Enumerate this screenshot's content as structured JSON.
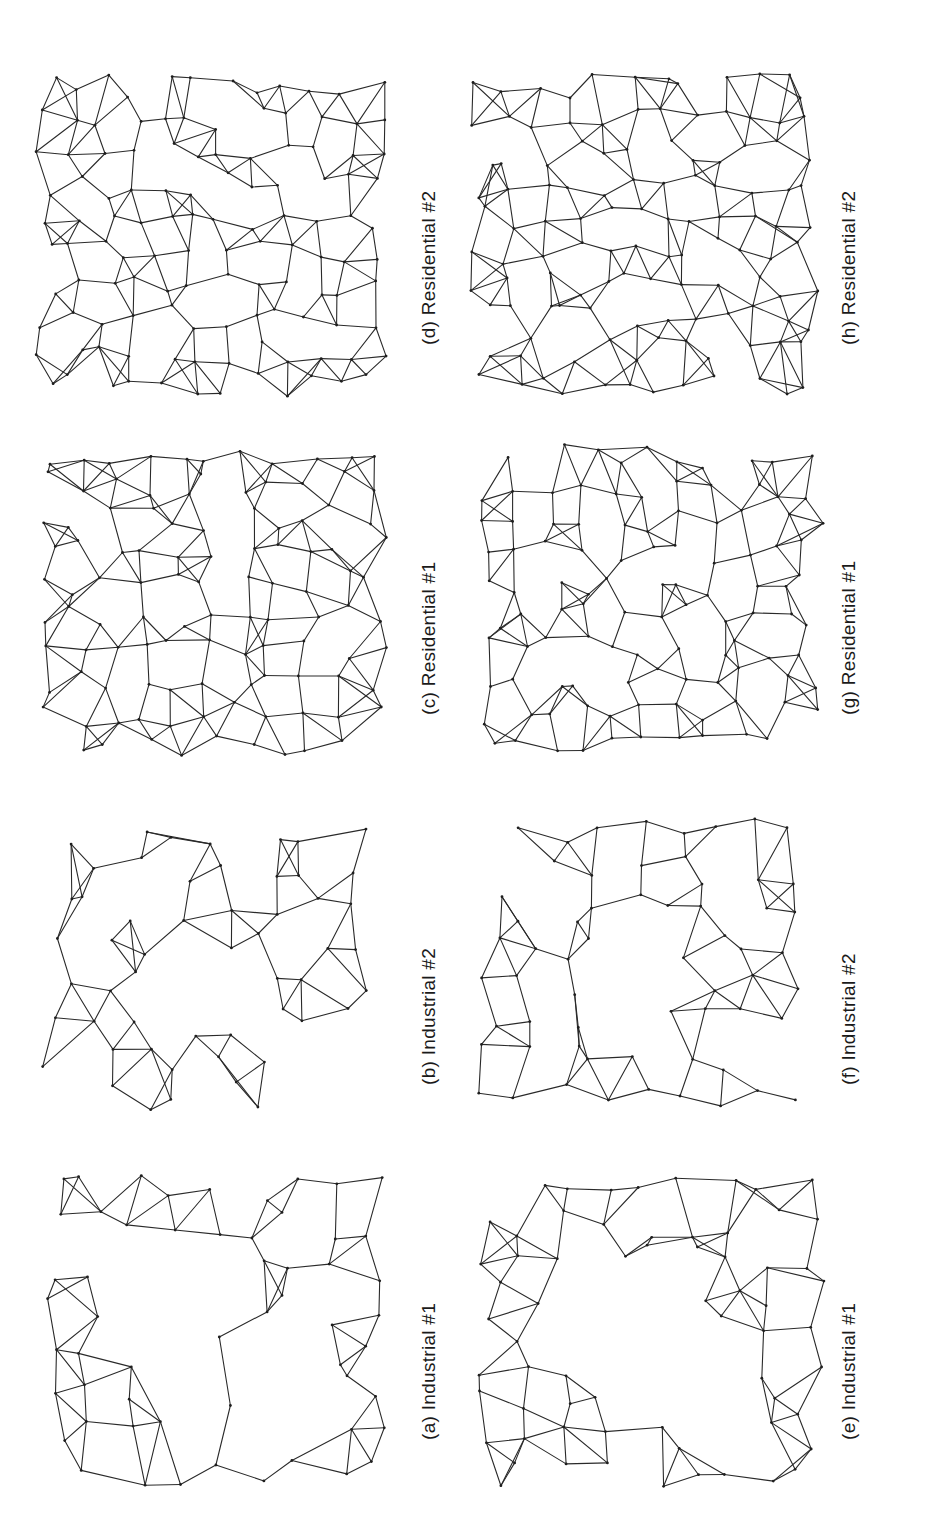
{
  "figure": {
    "orientation": "rotated-90-ccw",
    "panels": [
      {
        "id": "a",
        "caption": "(a)  Industrial #1",
        "column": "left",
        "row": 1,
        "cx": 215,
        "cy": 1330,
        "w": 370,
        "h": 330,
        "seed": 11,
        "nodes": 70,
        "style": "sparse-center"
      },
      {
        "id": "b",
        "caption": "(b)  Industrial #2",
        "column": "left",
        "row": 2,
        "cx": 205,
        "cy": 965,
        "w": 340,
        "h": 300,
        "seed": 23,
        "nodes": 62,
        "style": "blob"
      },
      {
        "id": "c",
        "caption": "(c)  Residential #1",
        "column": "left",
        "row": 3,
        "cx": 210,
        "cy": 600,
        "w": 360,
        "h": 330,
        "seed": 37,
        "nodes": 110,
        "style": "dense"
      },
      {
        "id": "d",
        "caption": "(d)  Residential #2",
        "column": "left",
        "row": 4,
        "cx": 210,
        "cy": 235,
        "w": 360,
        "h": 330,
        "seed": 41,
        "nodes": 125,
        "style": "dense"
      },
      {
        "id": "e",
        "caption": "(e)  Industrial #1",
        "column": "right",
        "row": 1,
        "cx": 650,
        "cy": 1330,
        "w": 360,
        "h": 320,
        "seed": 53,
        "nodes": 78,
        "style": "sparse-center"
      },
      {
        "id": "f",
        "caption": "(f)  Industrial #2",
        "column": "right",
        "row": 2,
        "cx": 640,
        "cy": 965,
        "w": 340,
        "h": 300,
        "seed": 67,
        "nodes": 68,
        "style": "blob"
      },
      {
        "id": "g",
        "caption": "(g)  Residential #1",
        "column": "right",
        "row": 3,
        "cx": 650,
        "cy": 600,
        "w": 355,
        "h": 320,
        "seed": 71,
        "nodes": 115,
        "style": "dense"
      },
      {
        "id": "h",
        "caption": "(h)  Residential #2",
        "column": "right",
        "row": 4,
        "cx": 645,
        "cy": 235,
        "w": 355,
        "h": 330,
        "seed": 89,
        "nodes": 125,
        "style": "dense"
      }
    ],
    "captions_position": [
      {
        "id": "a",
        "x": 418,
        "y": 1440
      },
      {
        "id": "b",
        "x": 418,
        "y": 1085
      },
      {
        "id": "c",
        "x": 418,
        "y": 715
      },
      {
        "id": "d",
        "x": 418,
        "y": 345
      },
      {
        "id": "e",
        "x": 838,
        "y": 1440
      },
      {
        "id": "f",
        "x": 838,
        "y": 1085
      },
      {
        "id": "g",
        "x": 838,
        "y": 715
      },
      {
        "id": "h",
        "x": 838,
        "y": 345
      }
    ],
    "colors": {
      "background": "#ffffff",
      "edge": "#2a2a2a",
      "node": "#1e1e1e",
      "text": "#1a1a1a"
    }
  }
}
